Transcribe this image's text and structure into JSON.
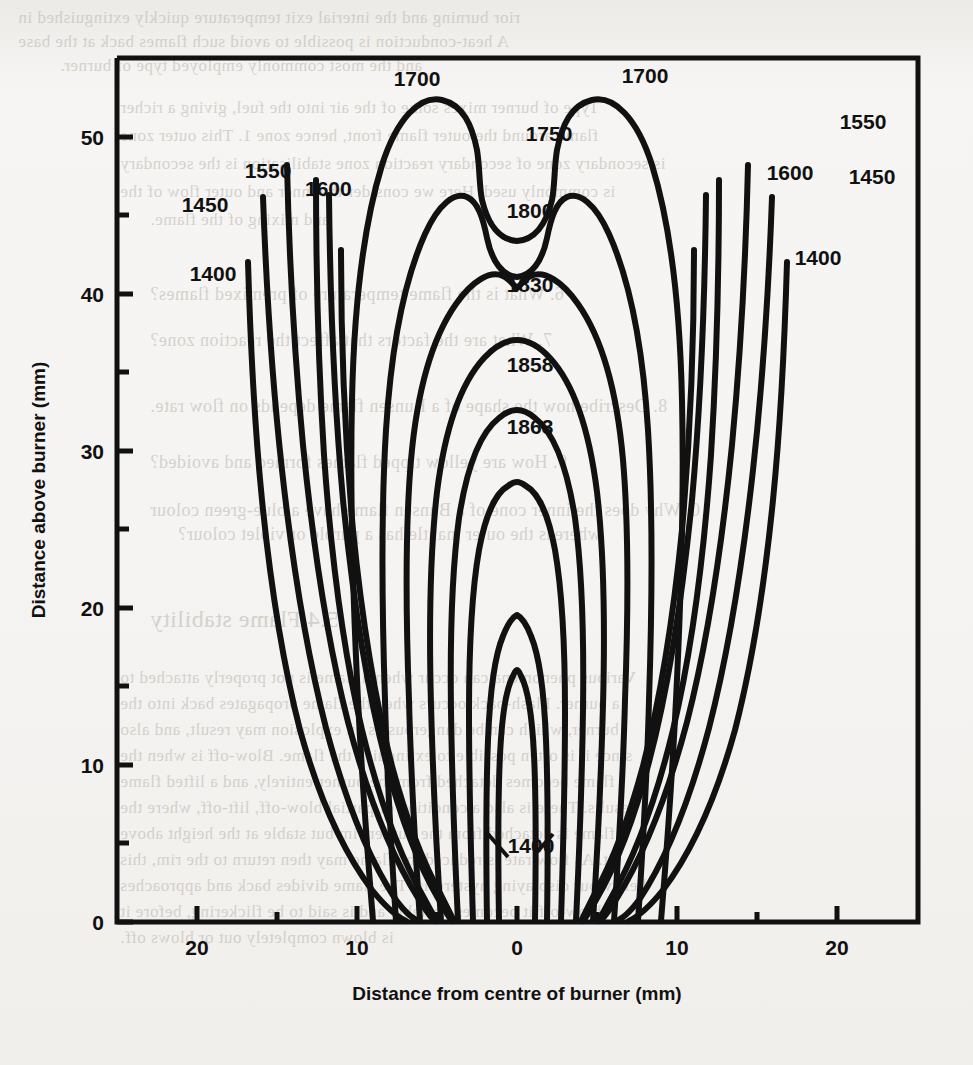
{
  "page": {
    "background_color": "#f4f3f1",
    "ink_color": "#111111",
    "ghost_text_color": "#b9b5ae"
  },
  "ghost_text": {
    "note": "faint mirrored bleed-through text from the reverse side of the scanned page",
    "lines": [
      {
        "text": "rior burning and the interial exit temperature quickly extinguished in",
        "x": 18,
        "y": 8,
        "size": 17
      },
      {
        "text": "A heat-conduction is possible to avoid such flames back at the base",
        "x": 18,
        "y": 32,
        "size": 17
      },
      {
        "text": "and the most commonly employed type of burner.",
        "x": 60,
        "y": 56,
        "size": 17
      },
      {
        "text": "Type of burner mixes some of the air into the fuel, giving a richer",
        "x": 120,
        "y": 98,
        "size": 17
      },
      {
        "text": "flame around the outer flame front, hence zone 1. This outer zone",
        "x": 120,
        "y": 126,
        "size": 17
      },
      {
        "text": "is secondary zone of secondary reaction zone stabilisation is the secondary",
        "x": 120,
        "y": 154,
        "size": 17
      },
      {
        "text": "is commonly used. Here we consider the inner and outer flow of the",
        "x": 120,
        "y": 182,
        "size": 17
      },
      {
        "text": "and mixing of the flame.",
        "x": 150,
        "y": 210,
        "size": 17
      },
      {
        "text": "6.  What is the flame temperature of premixed flames?",
        "x": 150,
        "y": 284,
        "size": 18
      },
      {
        "text": "7.  What are the factors that affect the reaction zone?",
        "x": 150,
        "y": 330,
        "size": 18
      },
      {
        "text": "8.  Describe how the shape of a Bunsen flame depends on flow rate.",
        "x": 150,
        "y": 396,
        "size": 18
      },
      {
        "text": "9.  How are yellow tipped flames formed and avoided?",
        "x": 150,
        "y": 452,
        "size": 18
      },
      {
        "text": "10. Why does the inner cone of a Bunsen flame have a blue-green colour",
        "x": 150,
        "y": 500,
        "size": 18
      },
      {
        "text": "whereas the outer mantle has a purple or violet colour?",
        "x": 178,
        "y": 524,
        "size": 18
      },
      {
        "text": "5.4   Flame stability",
        "x": 150,
        "y": 606,
        "size": 24
      },
      {
        "text": "Various phenomena can occur when a flame is not properly attached to",
        "x": 120,
        "y": 668,
        "size": 17
      },
      {
        "text": "a burner. Flash-back occurs when the flame propagates back into the",
        "x": 120,
        "y": 694,
        "size": 17
      },
      {
        "text": "burner, which can be dangerous as an explosion may result, and also",
        "x": 120,
        "y": 720,
        "size": 17
      },
      {
        "text": "since it is often possible to extinguish the flame. Blow-off is when the",
        "x": 120,
        "y": 746,
        "size": 17
      },
      {
        "text": "flame becomes detached from the burner entirely, and a lifted flame",
        "x": 120,
        "y": 772,
        "size": 17
      },
      {
        "text": "results. There is also a condition of partial blow-off, lift-off, where the",
        "x": 120,
        "y": 798,
        "size": 17
      },
      {
        "text": "flame is detached from the burner rim but stable at the height above",
        "x": 120,
        "y": 824,
        "size": 17
      },
      {
        "text": "it. As flow rate is reduced the flame may then return to the rim, this",
        "x": 120,
        "y": 850,
        "size": 17
      },
      {
        "text": "behaviour displaying hysteresis. The flame divides back and approaches",
        "x": 120,
        "y": 876,
        "size": 17
      },
      {
        "text": "blow-off it becomes unstable and is said to be flickering, before it",
        "x": 120,
        "y": 902,
        "size": 17
      },
      {
        "text": "is blown completely out or blows off.",
        "x": 120,
        "y": 928,
        "size": 17
      }
    ]
  },
  "chart_data": {
    "type": "contour",
    "title": "",
    "xlabel": "Distance from centre of burner (mm)",
    "ylabel": "Distance above burner (mm)",
    "xlim": [
      -25,
      25
    ],
    "ylim": [
      0,
      55
    ],
    "grid": false,
    "legend_position": "none",
    "x_ticks_major": [
      -20,
      -10,
      0,
      10,
      20
    ],
    "x_tick_labels": [
      "20",
      "10",
      "0",
      "10",
      "20"
    ],
    "x_ticks_minor": [
      -15,
      -5,
      5,
      15
    ],
    "y_ticks_major": [
      0,
      10,
      20,
      30,
      40,
      50
    ],
    "y_tick_labels": [
      "0",
      "10",
      "20",
      "30",
      "40",
      "50"
    ],
    "y_ticks_minor": [
      5,
      15,
      25,
      35,
      45
    ],
    "units": "degrees Celsius (temperature contours)",
    "contour_levels": [
      1400,
      1450,
      1550,
      1600,
      1700,
      1750,
      1800,
      1830,
      1858,
      1863
    ],
    "contour_labels": [
      {
        "value": "1450",
        "side": "left",
        "x_px": 205,
        "y_px": 212
      },
      {
        "value": "1550",
        "side": "left",
        "x_px": 268,
        "y_px": 178
      },
      {
        "value": "1600",
        "side": "left",
        "x_px": 305,
        "y_px": 196
      },
      {
        "value": "1400",
        "side": "left",
        "x_px": 213,
        "y_px": 281
      },
      {
        "value": "1700",
        "side": "top-left",
        "x_px": 417,
        "y_px": 86
      },
      {
        "value": "1750",
        "side": "centre",
        "x_px": 549,
        "y_px": 141
      },
      {
        "value": "1700",
        "side": "top-right",
        "x_px": 645,
        "y_px": 83
      },
      {
        "value": "1800",
        "side": "centre",
        "x_px": 530,
        "y_px": 218
      },
      {
        "value": "1830",
        "side": "centre",
        "x_px": 530,
        "y_px": 292
      },
      {
        "value": "1858",
        "side": "centre",
        "x_px": 530,
        "y_px": 372
      },
      {
        "value": "1863",
        "side": "centre",
        "x_px": 530,
        "y_px": 434
      },
      {
        "value": "1400",
        "side": "bottom-centre",
        "x_px": 531,
        "y_px": 853
      },
      {
        "value": "1550",
        "side": "right",
        "x_px": 863,
        "y_px": 129
      },
      {
        "value": "1600",
        "side": "right",
        "x_px": 790,
        "y_px": 180
      },
      {
        "value": "1450",
        "side": "right",
        "x_px": 872,
        "y_px": 184
      },
      {
        "value": "1400",
        "side": "right",
        "x_px": 818,
        "y_px": 265
      }
    ]
  }
}
